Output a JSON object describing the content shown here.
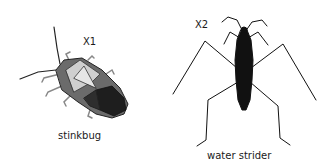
{
  "figures": [
    {
      "name": "stinkbug",
      "magnification": "X1",
      "caption": "stinkbug"
    },
    {
      "name": "water strider",
      "magnification": "X2",
      "caption": "water strider"
    }
  ]
}
